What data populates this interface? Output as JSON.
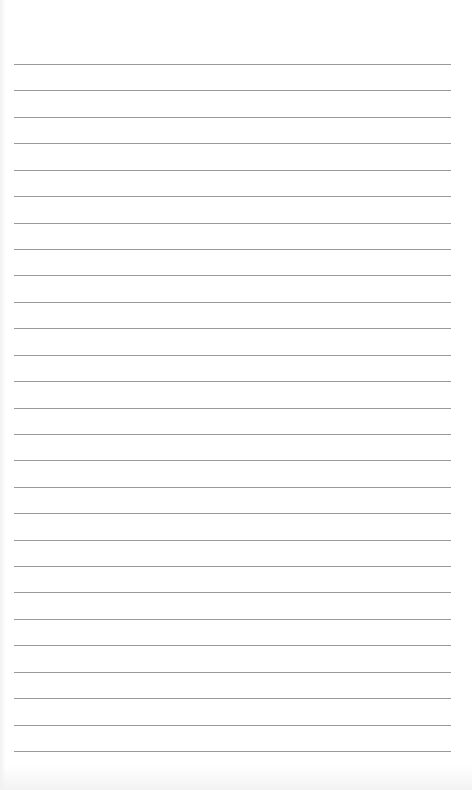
{
  "document": {
    "type": "lined-paper",
    "line_count": 27,
    "line_color": "#9a9a9a",
    "paper_color": "#ffffff",
    "text": ""
  }
}
